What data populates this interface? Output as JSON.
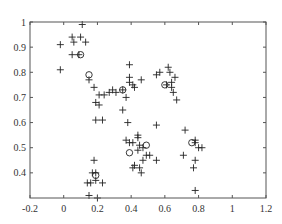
{
  "chart_data": {
    "type": "scatter",
    "title": "",
    "xlabel": "",
    "ylabel": "",
    "xlim": [
      -0.2,
      1.2
    ],
    "ylim": [
      0.3,
      1.0
    ],
    "grid": false,
    "legend": null,
    "x_ticks": [
      "-0.2",
      "0",
      "0.2",
      "0.4",
      "0.6",
      "0.8",
      "1",
      "1.2"
    ],
    "x_tick_values": [
      -0.2,
      0,
      0.2,
      0.4,
      0.6,
      0.8,
      1,
      1.2
    ],
    "y_ticks": [
      "0.4",
      "0.5",
      "0.6",
      "0.7",
      "0.8",
      "0.9",
      "1"
    ],
    "y_tick_values": [
      0.4,
      0.5,
      0.6,
      0.7,
      0.8,
      0.9,
      1.0
    ],
    "series": [
      {
        "name": "data points",
        "marker": "+",
        "points": [
          [
            0.11,
            0.99
          ],
          [
            0.05,
            0.94
          ],
          [
            0.06,
            0.92
          ],
          [
            0.1,
            0.94
          ],
          [
            0.13,
            0.92
          ],
          [
            -0.02,
            0.91
          ],
          [
            0.05,
            0.87
          ],
          [
            0.09,
            0.87
          ],
          [
            -0.02,
            0.81
          ],
          [
            0.39,
            0.83
          ],
          [
            0.39,
            0.78
          ],
          [
            0.39,
            0.76
          ],
          [
            0.41,
            0.75
          ],
          [
            0.42,
            0.74
          ],
          [
            0.46,
            0.77
          ],
          [
            0.15,
            0.77
          ],
          [
            0.18,
            0.74
          ],
          [
            0.21,
            0.71
          ],
          [
            0.24,
            0.71
          ],
          [
            0.27,
            0.72
          ],
          [
            0.29,
            0.73
          ],
          [
            0.31,
            0.72
          ],
          [
            0.35,
            0.73
          ],
          [
            0.37,
            0.7
          ],
          [
            0.19,
            0.68
          ],
          [
            0.21,
            0.67
          ],
          [
            0.35,
            0.65
          ],
          [
            0.57,
            0.8
          ],
          [
            0.55,
            0.79
          ],
          [
            0.62,
            0.82
          ],
          [
            0.63,
            0.8
          ],
          [
            0.66,
            0.78
          ],
          [
            0.64,
            0.76
          ],
          [
            0.64,
            0.74
          ],
          [
            0.61,
            0.75
          ],
          [
            0.65,
            0.72
          ],
          [
            0.67,
            0.69
          ],
          [
            0.19,
            0.61
          ],
          [
            0.23,
            0.61
          ],
          [
            0.38,
            0.6
          ],
          [
            0.37,
            0.53
          ],
          [
            0.39,
            0.52
          ],
          [
            0.41,
            0.52
          ],
          [
            0.44,
            0.55
          ],
          [
            0.44,
            0.54
          ],
          [
            0.45,
            0.51
          ],
          [
            0.47,
            0.5
          ],
          [
            0.44,
            0.49
          ],
          [
            0.49,
            0.47
          ],
          [
            0.51,
            0.47
          ],
          [
            0.47,
            0.45
          ],
          [
            0.55,
            0.45
          ],
          [
            0.42,
            0.43
          ],
          [
            0.41,
            0.42
          ],
          [
            0.45,
            0.42
          ],
          [
            0.46,
            0.4
          ],
          [
            0.55,
            0.59
          ],
          [
            0.72,
            0.57
          ],
          [
            0.78,
            0.53
          ],
          [
            0.78,
            0.52
          ],
          [
            0.8,
            0.5
          ],
          [
            0.82,
            0.5
          ],
          [
            0.71,
            0.47
          ],
          [
            0.78,
            0.45
          ],
          [
            0.77,
            0.42
          ],
          [
            0.78,
            0.33
          ],
          [
            0.18,
            0.45
          ],
          [
            0.17,
            0.4
          ],
          [
            0.19,
            0.4
          ],
          [
            0.14,
            0.36
          ],
          [
            0.16,
            0.36
          ],
          [
            0.19,
            0.37
          ],
          [
            0.23,
            0.36
          ],
          [
            0.15,
            0.31
          ],
          [
            0.2,
            0.3
          ]
        ]
      },
      {
        "name": "centers",
        "marker": "o",
        "points": [
          [
            0.1,
            0.87
          ],
          [
            0.15,
            0.79
          ],
          [
            0.35,
            0.73
          ],
          [
            0.6,
            0.75
          ],
          [
            0.19,
            0.39
          ],
          [
            0.39,
            0.48
          ],
          [
            0.49,
            0.51
          ],
          [
            0.76,
            0.52
          ]
        ]
      }
    ]
  }
}
